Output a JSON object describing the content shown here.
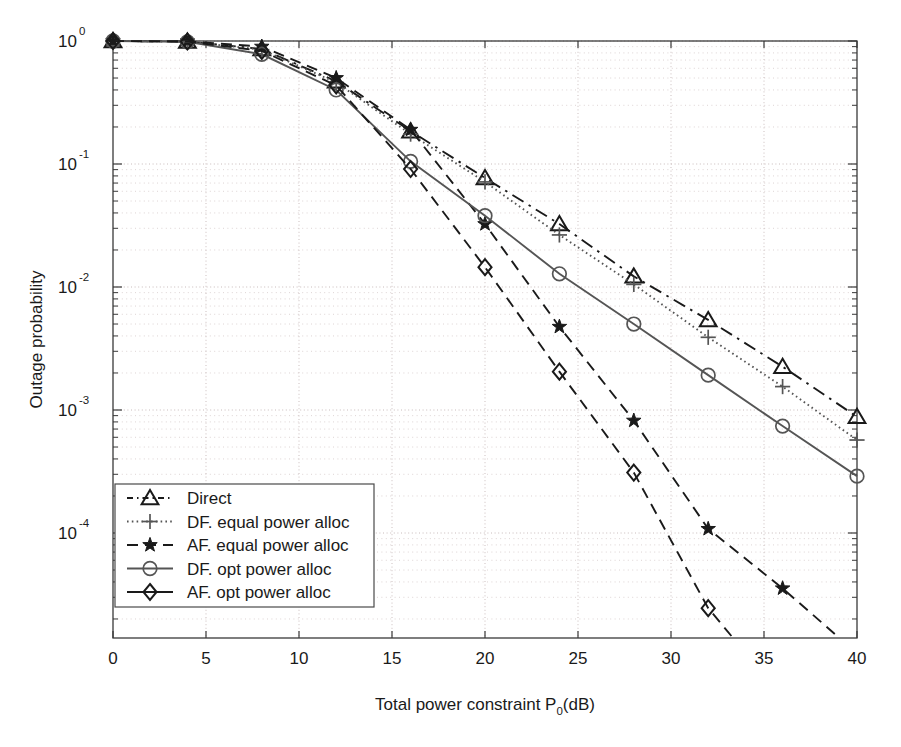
{
  "figure": {
    "background": "#ffffff",
    "width": 901,
    "height": 747
  },
  "chart_data": {
    "type": "line",
    "title": "",
    "xlabel": "Total power constraint P₀(dB)",
    "xlabel_parts": {
      "pre": "Total power constraint P",
      "sub": "0",
      "post": "(dB)"
    },
    "ylabel": "Outage probability",
    "xlim": [
      0,
      40
    ],
    "ylim": [
      3e-05,
      1.0
    ],
    "yscale": "log",
    "xscale": "linear",
    "grid": true,
    "grid_style": "dotted",
    "legend_position": "lower left",
    "xticks": [
      0,
      5,
      10,
      15,
      20,
      25,
      30,
      35,
      40
    ],
    "xtick_labels": [
      "0",
      "5",
      "10",
      "15",
      "20",
      "25",
      "30",
      "35",
      "40"
    ],
    "yticks": [
      1.0,
      0.1,
      0.01,
      0.001,
      0.0001
    ],
    "ytick_labels": [
      "10^0",
      "10^-1",
      "10^-2",
      "10^-3",
      "10^-4"
    ],
    "ytick_mantissa": "10",
    "ytick_exponents": [
      "0",
      "-1",
      "-2",
      "-3",
      "-4"
    ],
    "x": [
      0,
      4,
      8,
      12,
      16,
      20,
      24,
      28,
      32,
      36,
      40
    ],
    "series": [
      {
        "name": "Direct",
        "label": "Direct",
        "marker": "triangle",
        "linestyle": "dashdot",
        "color": "#1a1a1a",
        "values": [
          1.0,
          0.99,
          0.86,
          0.47,
          0.185,
          0.077,
          0.0325,
          0.0122,
          0.0054,
          0.00225,
          0.00088
        ]
      },
      {
        "name": "DF. equal power alloc",
        "label": "DF. equal power alloc",
        "marker": "plus",
        "linestyle": "dotted",
        "color": "#555555",
        "values": [
          1.0,
          0.99,
          0.85,
          0.46,
          0.175,
          0.0715,
          0.0265,
          0.0105,
          0.0039,
          0.00155,
          0.00057
        ]
      },
      {
        "name": "AF. equal power alloc",
        "label": "AF. equal power alloc",
        "marker": "star",
        "linestyle": "dashed",
        "color": "#1a1a1a",
        "values": [
          1.0,
          0.995,
          0.9,
          0.5,
          0.19,
          0.0325,
          0.00475,
          0.00082,
          0.000108,
          3.55e-05,
          1.05e-05
        ]
      },
      {
        "name": "DF. opt power alloc",
        "label": "DF. opt power alloc",
        "marker": "circle",
        "linestyle": "solid",
        "color": "#555555",
        "values": [
          1.0,
          0.985,
          0.78,
          0.4,
          0.105,
          0.038,
          0.0128,
          0.005,
          0.00192,
          0.00074,
          0.00029
        ]
      },
      {
        "name": "AF. opt power alloc",
        "label": "AF. opt power alloc",
        "marker": "diamond",
        "linestyle": "dashed",
        "color": "#1a1a1a",
        "values": [
          1.0,
          0.99,
          0.83,
          0.435,
          0.091,
          0.0145,
          0.00205,
          0.00031,
          2.45e-05,
          4.6e-06,
          1.2e-06
        ]
      }
    ]
  },
  "legend": {
    "items": [
      {
        "label": "Direct",
        "marker": "triangle",
        "linestyle": "dashdot"
      },
      {
        "label": "DF. equal power alloc",
        "marker": "plus",
        "linestyle": "dotted"
      },
      {
        "label": "AF. equal power alloc",
        "marker": "star",
        "linestyle": "dashed"
      },
      {
        "label": "DF. opt power alloc",
        "marker": "circle",
        "linestyle": "solid"
      },
      {
        "label": "AF. opt power alloc",
        "marker": "diamond",
        "linestyle": "solid"
      }
    ]
  }
}
